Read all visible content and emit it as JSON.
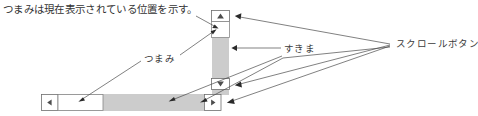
{
  "figure": {
    "caption": "つまみは現在表示されている位置を示す。",
    "width": 478,
    "height": 116
  },
  "annotations": {
    "thumb_label": "つまみ",
    "gap_label": "すきま",
    "scroll_button_label": "スクロールボタン"
  },
  "colors": {
    "track": "#cccccc",
    "thumb": "#ffffff",
    "thumb_border": "#888888",
    "button_face": "#ffffff",
    "button_border": "#6e6e6e",
    "glyph": "#4d4d4d",
    "leader_line": "#4a4a4a",
    "text": "#333333",
    "background": "#ffffff"
  },
  "vertical_scrollbar": {
    "name": "vertical-scrollbar",
    "up_button_glyph": "▲",
    "down_button_glyph": "▼",
    "thumb_position": "top",
    "orientation": "vertical"
  },
  "horizontal_scrollbar": {
    "name": "horizontal-scrollbar",
    "left_button_glyph": "◀",
    "right_button_glyph": "▶",
    "thumb_position": "left",
    "orientation": "horizontal"
  }
}
